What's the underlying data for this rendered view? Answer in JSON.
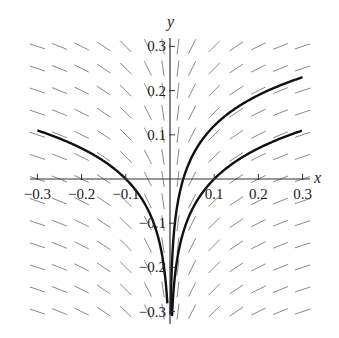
{
  "chart_data": {
    "type": "line",
    "title": "",
    "xlabel": "x",
    "ylabel": "y",
    "xlim": [
      -0.3,
      0.3
    ],
    "ylim": [
      -0.3,
      0.3
    ],
    "x_ticks": [
      -0.3,
      -0.2,
      -0.1,
      0.1,
      0.2,
      0.3
    ],
    "x_tick_labels": [
      "−0.3",
      "−0.2",
      "−0.1",
      "0.1",
      "0.2",
      "0.3"
    ],
    "y_ticks": [
      -0.3,
      -0.2,
      -0.1,
      0.1,
      0.2,
      0.3
    ],
    "y_tick_labels": [
      "−0.3",
      "−0.2",
      "−0.1",
      "0.1",
      "0.2",
      "0.3"
    ],
    "grid": false,
    "slope_field": {
      "description": "direction field dy/dx = 0.1/x",
      "grid_x_count": 13,
      "grid_y_count": 13,
      "color": "#888888"
    },
    "series": [
      {
        "name": "solution-left",
        "equation": "y = 0.1*ln(|x|/0.1), x<0",
        "points": [
          [
            -0.3,
            0.11
          ],
          [
            -0.2,
            0.069
          ],
          [
            -0.1,
            0.0
          ],
          [
            -0.05,
            -0.069
          ],
          [
            -0.02,
            -0.16
          ],
          [
            -0.01,
            -0.23
          ],
          [
            -0.005,
            -0.3
          ]
        ]
      },
      {
        "name": "solution-right-upper",
        "equation": "y = 0.1*ln(x/0.03), x>0",
        "points": [
          [
            0.003,
            -0.23
          ],
          [
            0.01,
            -0.11
          ],
          [
            0.03,
            0.0
          ],
          [
            0.1,
            0.12
          ],
          [
            0.2,
            0.19
          ],
          [
            0.3,
            0.23
          ]
        ]
      },
      {
        "name": "solution-right-lower",
        "equation": "y = 0.1*ln(x/0.1), x>0",
        "points": [
          [
            0.005,
            -0.3
          ],
          [
            0.02,
            -0.16
          ],
          [
            0.05,
            -0.069
          ],
          [
            0.1,
            0.0
          ],
          [
            0.2,
            0.069
          ],
          [
            0.3,
            0.11
          ]
        ]
      }
    ],
    "colors": {
      "curve": "#111111",
      "axis": "#333333",
      "field": "#8a8a8a",
      "text": "#222222"
    }
  }
}
